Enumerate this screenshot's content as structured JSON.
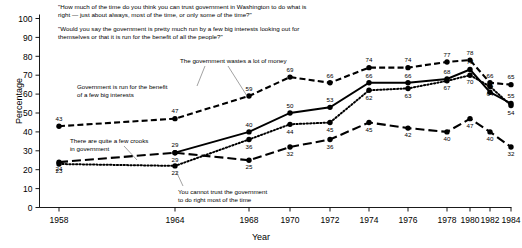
{
  "chart_data": {
    "type": "line",
    "title": "",
    "xlabel": "Year",
    "ylabel": "Percentage",
    "ylim": [
      0,
      100
    ],
    "ytick_step": 10,
    "yticks": [
      0,
      10,
      20,
      30,
      40,
      50,
      60,
      70,
      80,
      90,
      100
    ],
    "categories": [
      1958,
      1964,
      1968,
      1970,
      1972,
      1974,
      1976,
      1978,
      1980,
      1982,
      1984
    ],
    "x": [
      1958,
      1964,
      1968,
      1970,
      1972,
      1974,
      1976,
      1978,
      1980,
      1982,
      1984
    ],
    "grid": false,
    "legend": "none",
    "series": [
      {
        "name": "The government wastes a lot of money",
        "style": "dashed",
        "values": [
          43,
          47,
          59,
          69,
          66,
          74,
          74,
          77,
          78,
          66,
          65
        ]
      },
      {
        "name": "Government is run for the benefit of a few big interests",
        "style": "solid",
        "values": [
          null,
          29,
          40,
          50,
          53,
          66,
          66,
          68,
          73,
          61,
          55
        ]
      },
      {
        "name": "You cannot trust the government to do right most of the time",
        "style": "dotted",
        "values": [
          23,
          22,
          36,
          44,
          45,
          62,
          63,
          67,
          70,
          64,
          54
        ]
      },
      {
        "name": "There are quite a few crooks in government",
        "style": "longdash",
        "values": [
          24,
          29,
          25,
          32,
          36,
          45,
          42,
          40,
          47,
          40,
          32
        ]
      }
    ]
  },
  "quotes": {
    "quote_1": "\"How much of the time do you think you can trust government in Washington to do what is\nright — just about always, most of the time, or only some of the time?\"",
    "quote_2": "\"Would you say the government is pretty much run by a few big interests looking out for\nthemselves or that it is run for the benefit of all the people?\""
  },
  "annotations": {
    "big_interests": "Government is run for the benefit\nof a few big interests",
    "crooks": "There are quite a few crooks\nin government",
    "wastes": "The government wastes a lot of money",
    "cannot_trust": "You cannot trust the government\nto do right most of the time"
  },
  "colors": {
    "line": "#000000",
    "axis": "#000000",
    "background": "#ffffff"
  }
}
